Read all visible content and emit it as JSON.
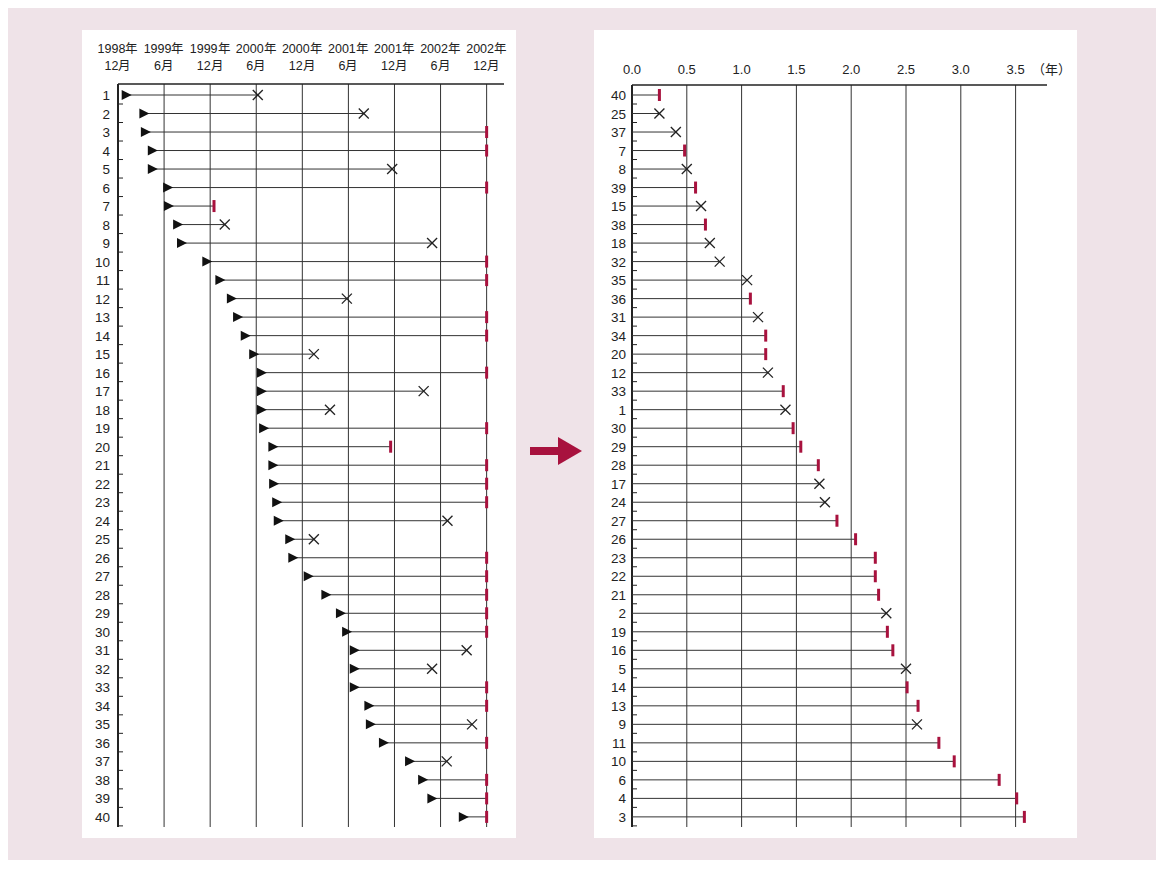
{
  "colors": {
    "background": "#efe3e8",
    "panel": "#ffffff",
    "axis": "#222222",
    "censor_mark": "#a8123e",
    "event_mark": "#222222",
    "arrow": "#a8123e"
  },
  "arrow": {
    "icon": "right-arrow-icon",
    "color": "#a8123e"
  },
  "chart_data": [
    {
      "type": "timeline",
      "title": "",
      "description": "Patient enrollment timeline by calendar date: triangle marks entry, X marks event, red bar marks censoring at study end",
      "x_ticks": [
        {
          "year": "1998年",
          "month": "12月"
        },
        {
          "year": "1999年",
          "month": "6月"
        },
        {
          "year": "1999年",
          "month": "12月"
        },
        {
          "year": "2000年",
          "month": "6月"
        },
        {
          "year": "2000年",
          "month": "12月"
        },
        {
          "year": "2001年",
          "month": "6月"
        },
        {
          "year": "2001年",
          "month": "12月"
        },
        {
          "year": "2002年",
          "month": "6月"
        },
        {
          "year": "2002年",
          "month": "12月"
        }
      ],
      "x_unit": "months since 1998-12",
      "xlim": [
        0,
        48
      ],
      "legend": {
        "start": "triangle",
        "event": "×",
        "censored": "red bar"
      },
      "rows": [
        {
          "id": "1",
          "start": 1.0,
          "end": 18.2,
          "status": "event"
        },
        {
          "id": "2",
          "start": 3.3,
          "end": 32.0,
          "status": "event"
        },
        {
          "id": "3",
          "start": 3.5,
          "end": 48.0,
          "status": "censored"
        },
        {
          "id": "4",
          "start": 4.4,
          "end": 48.0,
          "status": "censored"
        },
        {
          "id": "5",
          "start": 4.4,
          "end": 35.7,
          "status": "event"
        },
        {
          "id": "6",
          "start": 6.4,
          "end": 48.0,
          "status": "censored"
        },
        {
          "id": "7",
          "start": 6.5,
          "end": 12.5,
          "status": "censored"
        },
        {
          "id": "8",
          "start": 7.7,
          "end": 13.9,
          "status": "event"
        },
        {
          "id": "9",
          "start": 8.2,
          "end": 40.9,
          "status": "event"
        },
        {
          "id": "10",
          "start": 11.5,
          "end": 48.0,
          "status": "censored"
        },
        {
          "id": "11",
          "start": 13.2,
          "end": 48.0,
          "status": "censored"
        },
        {
          "id": "12",
          "start": 14.7,
          "end": 29.8,
          "status": "event"
        },
        {
          "id": "13",
          "start": 15.5,
          "end": 48.0,
          "status": "censored"
        },
        {
          "id": "14",
          "start": 16.5,
          "end": 48.0,
          "status": "censored"
        },
        {
          "id": "15",
          "start": 17.6,
          "end": 25.5,
          "status": "event"
        },
        {
          "id": "16",
          "start": 18.6,
          "end": 48.0,
          "status": "censored"
        },
        {
          "id": "17",
          "start": 18.6,
          "end": 39.8,
          "status": "event"
        },
        {
          "id": "18",
          "start": 18.6,
          "end": 27.6,
          "status": "event"
        },
        {
          "id": "19",
          "start": 18.9,
          "end": 48.0,
          "status": "censored"
        },
        {
          "id": "20",
          "start": 20.1,
          "end": 35.5,
          "status": "censored"
        },
        {
          "id": "21",
          "start": 20.1,
          "end": 48.0,
          "status": "censored"
        },
        {
          "id": "22",
          "start": 20.2,
          "end": 48.0,
          "status": "censored"
        },
        {
          "id": "23",
          "start": 20.6,
          "end": 48.0,
          "status": "censored"
        },
        {
          "id": "24",
          "start": 20.8,
          "end": 42.9,
          "status": "event"
        },
        {
          "id": "25",
          "start": 22.3,
          "end": 25.5,
          "status": "event"
        },
        {
          "id": "26",
          "start": 22.7,
          "end": 48.0,
          "status": "censored"
        },
        {
          "id": "27",
          "start": 24.7,
          "end": 48.0,
          "status": "censored"
        },
        {
          "id": "28",
          "start": 27.0,
          "end": 48.0,
          "status": "censored"
        },
        {
          "id": "29",
          "start": 28.9,
          "end": 48.0,
          "status": "censored"
        },
        {
          "id": "30",
          "start": 29.7,
          "end": 48.0,
          "status": "censored"
        },
        {
          "id": "31",
          "start": 30.7,
          "end": 45.4,
          "status": "event"
        },
        {
          "id": "32",
          "start": 30.7,
          "end": 40.9,
          "status": "event"
        },
        {
          "id": "33",
          "start": 30.7,
          "end": 48.0,
          "status": "censored"
        },
        {
          "id": "34",
          "start": 32.6,
          "end": 48.0,
          "status": "censored"
        },
        {
          "id": "35",
          "start": 32.8,
          "end": 46.1,
          "status": "event"
        },
        {
          "id": "36",
          "start": 34.5,
          "end": 48.0,
          "status": "censored"
        },
        {
          "id": "37",
          "start": 37.9,
          "end": 42.8,
          "status": "event"
        },
        {
          "id": "38",
          "start": 39.6,
          "end": 48.0,
          "status": "censored"
        },
        {
          "id": "39",
          "start": 40.8,
          "end": 48.0,
          "status": "censored"
        },
        {
          "id": "40",
          "start": 44.9,
          "end": 48.0,
          "status": "censored"
        }
      ]
    },
    {
      "type": "timeline",
      "title": "",
      "description": "Same patients re-aligned to time zero and sorted by follow-up duration (years)",
      "x_ticks": [
        "0.0",
        "0.5",
        "1.0",
        "1.5",
        "2.0",
        "2.5",
        "3.0",
        "3.5"
      ],
      "x_unit_label": "（年）",
      "xlabel": "年",
      "xlim": [
        0,
        3.9
      ],
      "rows": [
        {
          "id": "40",
          "duration": 0.25,
          "status": "censored"
        },
        {
          "id": "25",
          "duration": 0.25,
          "status": "event"
        },
        {
          "id": "37",
          "duration": 0.4,
          "status": "event"
        },
        {
          "id": "7",
          "duration": 0.48,
          "status": "censored"
        },
        {
          "id": "8",
          "duration": 0.5,
          "status": "event"
        },
        {
          "id": "39",
          "duration": 0.58,
          "status": "censored"
        },
        {
          "id": "15",
          "duration": 0.63,
          "status": "event"
        },
        {
          "id": "38",
          "duration": 0.67,
          "status": "censored"
        },
        {
          "id": "18",
          "duration": 0.71,
          "status": "event"
        },
        {
          "id": "32",
          "duration": 0.8,
          "status": "event"
        },
        {
          "id": "35",
          "duration": 1.05,
          "status": "event"
        },
        {
          "id": "36",
          "duration": 1.08,
          "status": "censored"
        },
        {
          "id": "31",
          "duration": 1.15,
          "status": "event"
        },
        {
          "id": "34",
          "duration": 1.22,
          "status": "censored"
        },
        {
          "id": "20",
          "duration": 1.22,
          "status": "censored"
        },
        {
          "id": "12",
          "duration": 1.24,
          "status": "event"
        },
        {
          "id": "33",
          "duration": 1.38,
          "status": "censored"
        },
        {
          "id": "1",
          "duration": 1.4,
          "status": "event"
        },
        {
          "id": "30",
          "duration": 1.47,
          "status": "censored"
        },
        {
          "id": "29",
          "duration": 1.54,
          "status": "censored"
        },
        {
          "id": "28",
          "duration": 1.7,
          "status": "censored"
        },
        {
          "id": "17",
          "duration": 1.71,
          "status": "event"
        },
        {
          "id": "24",
          "duration": 1.76,
          "status": "event"
        },
        {
          "id": "27",
          "duration": 1.87,
          "status": "censored"
        },
        {
          "id": "26",
          "duration": 2.04,
          "status": "censored"
        },
        {
          "id": "23",
          "duration": 2.22,
          "status": "censored"
        },
        {
          "id": "22",
          "duration": 2.22,
          "status": "censored"
        },
        {
          "id": "21",
          "duration": 2.25,
          "status": "censored"
        },
        {
          "id": "2",
          "duration": 2.32,
          "status": "event"
        },
        {
          "id": "19",
          "duration": 2.33,
          "status": "censored"
        },
        {
          "id": "16",
          "duration": 2.38,
          "status": "censored"
        },
        {
          "id": "5",
          "duration": 2.5,
          "status": "event"
        },
        {
          "id": "14",
          "duration": 2.51,
          "status": "censored"
        },
        {
          "id": "13",
          "duration": 2.61,
          "status": "censored"
        },
        {
          "id": "9",
          "duration": 2.6,
          "status": "event"
        },
        {
          "id": "11",
          "duration": 2.8,
          "status": "censored"
        },
        {
          "id": "10",
          "duration": 2.94,
          "status": "censored"
        },
        {
          "id": "6",
          "duration": 3.35,
          "status": "censored"
        },
        {
          "id": "4",
          "duration": 3.51,
          "status": "censored"
        },
        {
          "id": "3",
          "duration": 3.58,
          "status": "censored"
        }
      ]
    }
  ]
}
